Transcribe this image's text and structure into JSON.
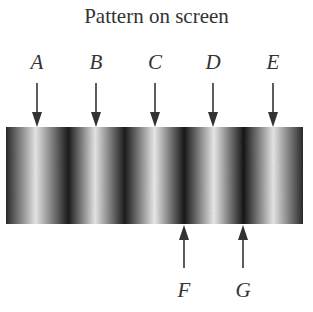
{
  "title": "Pattern on screen",
  "top_labels": [
    {
      "label": "A",
      "x": 37
    },
    {
      "label": "B",
      "x": 96
    },
    {
      "label": "C",
      "x": 155
    },
    {
      "label": "D",
      "x": 213
    },
    {
      "label": "E",
      "x": 273
    }
  ],
  "bottom_labels": [
    {
      "label": "F",
      "x": 184
    },
    {
      "label": "G",
      "x": 243
    }
  ],
  "pattern": {
    "description": "Alternating bright and dark interference fringes",
    "bright_fringes_x": [
      37,
      96,
      155,
      213,
      273
    ],
    "dark_fringes_x": [
      68,
      126,
      184,
      243
    ]
  }
}
